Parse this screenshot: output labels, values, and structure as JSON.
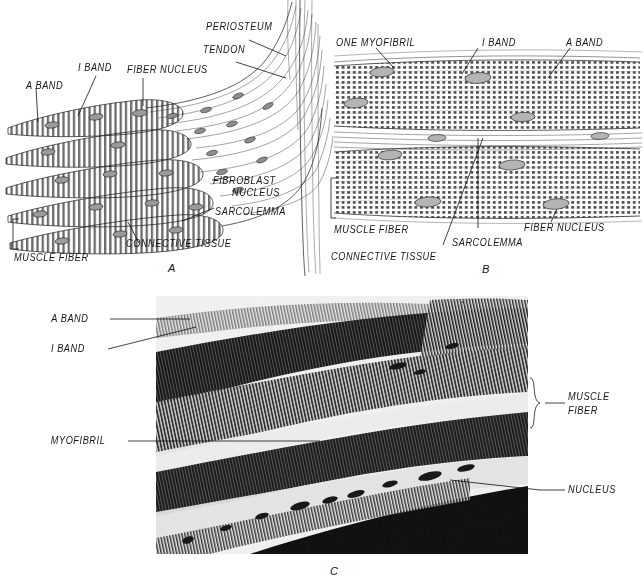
{
  "figure": {
    "background_color": "#ffffff",
    "ink_color": "#1a1a1a"
  },
  "panels": [
    {
      "id": "A",
      "letter": "A",
      "kind": "line-drawing",
      "description": "Muscle fiber ends inserting into tendon and periosteum",
      "labels": [
        {
          "name": "a-band",
          "text": "A BAND"
        },
        {
          "name": "i-band",
          "text": "I BAND"
        },
        {
          "name": "fiber-nucleus",
          "text": "FIBER NUCLEUS"
        },
        {
          "name": "periosteum",
          "text": "PERIOSTEUM"
        },
        {
          "name": "tendon",
          "text": "TENDON"
        },
        {
          "name": "fibroblast-nucleus-line1",
          "text": "FIBROBLAST"
        },
        {
          "name": "fibroblast-nucleus-line2",
          "text": "NUCLEUS"
        },
        {
          "name": "sarcolemma",
          "text": "SARCOLEMMA"
        },
        {
          "name": "connective-tissue",
          "text": "CONNECTIVE TISSUE"
        },
        {
          "name": "muscle-fiber",
          "text": "MUSCLE FIBER"
        }
      ]
    },
    {
      "id": "B",
      "letter": "B",
      "kind": "line-drawing",
      "description": "Two cross-striated muscle fibers separated by connective tissue",
      "labels": [
        {
          "name": "one-myofibril",
          "text": "ONE MYOFIBRIL"
        },
        {
          "name": "i-band",
          "text": "I BAND"
        },
        {
          "name": "a-band",
          "text": "A BAND"
        },
        {
          "name": "muscle-fiber",
          "text": "MUSCLE FIBER"
        },
        {
          "name": "sarcolemma",
          "text": "SARCOLEMMA"
        },
        {
          "name": "fiber-nucleus",
          "text": "FIBER NUCLEUS"
        },
        {
          "name": "connective-tissue",
          "text": "CONNECTIVE TISSUE"
        }
      ]
    },
    {
      "id": "C",
      "letter": "C",
      "kind": "photomicrograph",
      "description": "Black and white photomicrograph of striated skeletal muscle fibers",
      "labels": [
        {
          "name": "a-band",
          "text": "A BAND"
        },
        {
          "name": "i-band",
          "text": "I BAND"
        },
        {
          "name": "myofibril",
          "text": "MYOFIBRIL"
        },
        {
          "name": "muscle-fiber-line1",
          "text": "MUSCLE"
        },
        {
          "name": "muscle-fiber-line2",
          "text": "FIBER"
        },
        {
          "name": "nucleus",
          "text": "NUCLEUS"
        }
      ]
    }
  ]
}
